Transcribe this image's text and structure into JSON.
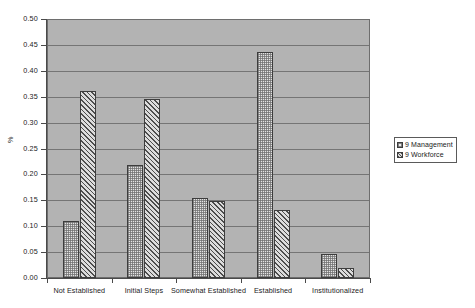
{
  "chart_data": {
    "type": "bar",
    "title": "",
    "xlabel": "",
    "ylabel": "%",
    "ylim": [
      0.0,
      0.5
    ],
    "ytick_step": 0.05,
    "ytick_labels": [
      "0.50",
      "0.45",
      "0.40",
      "0.35",
      "0.30",
      "0.25",
      "0.20",
      "0.15",
      "0.10",
      "0.05",
      "0.00"
    ],
    "ytick_values": [
      0.5,
      0.45,
      0.4,
      0.35,
      0.3,
      0.25,
      0.2,
      0.15,
      0.1,
      0.05,
      0.0
    ],
    "grid": true,
    "grid_axis": "y",
    "categories": [
      "Not Established",
      "Initial Steps",
      "Somewhat Established",
      "Established",
      "Institutionalized"
    ],
    "series": [
      {
        "name": "9 Management",
        "pattern": "fine-cross-hatch",
        "values": [
          0.11,
          0.218,
          0.154,
          0.436,
          0.046
        ]
      },
      {
        "name": "9 Workforce",
        "pattern": "diagonal-hatch",
        "values": [
          0.361,
          0.345,
          0.149,
          0.131,
          0.019
        ]
      }
    ],
    "legend": {
      "position": "right",
      "entries": [
        "9 Management",
        "9 Workforce"
      ]
    },
    "colors": {
      "plot_background": "#b3b3b3",
      "gridline": "#757575",
      "axis": "#4a4a4a",
      "bar_border": "#3d3d3d",
      "series_0_fill": "#e4e4e4",
      "series_1_fill": "#dcdcdc",
      "text": "#1a1a1a",
      "page_background": "#ffffff"
    }
  }
}
